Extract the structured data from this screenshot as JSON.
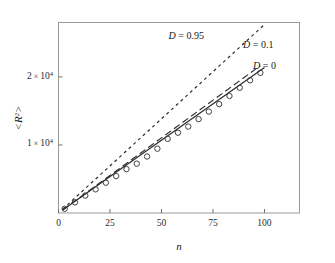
{
  "chart_data": {
    "type": "line",
    "title": "",
    "subtitle": "",
    "xlabel": "n",
    "ylabel": "<R^2>",
    "ylabel_display": "<R2>",
    "xlim": [
      0,
      117
    ],
    "ylim": [
      0,
      28000
    ],
    "grid": false,
    "legend_position": "inline-right",
    "frame": "box",
    "xticks": [
      0,
      25,
      50,
      75,
      100
    ],
    "xtick_labels": [
      "0",
      "25",
      "50",
      "75",
      "100"
    ],
    "yticks": [
      10000,
      20000
    ],
    "ytick_labels": [
      "1 × 10⁴",
      "2 × 10⁴"
    ],
    "ytick_mantissa": [
      "1",
      "2"
    ],
    "ytick_base": "10",
    "ytick_exponent": "4",
    "ytick_times": "×",
    "annotations": [
      {
        "text": "D = 0.95",
        "var": "D",
        "eq": "= 0.95",
        "x": 62,
        "y": 25600
      },
      {
        "text": "D = 0.1",
        "var": "D",
        "eq": "= 0.1",
        "x": 97,
        "y": 24300
      },
      {
        "text": "D = 0",
        "var": "D",
        "eq": "= 0",
        "x": 100,
        "y": 21100
      }
    ],
    "series": [
      {
        "name": "D = 0.95",
        "style": "dotted",
        "color": "#2b2b2b",
        "slope": 277.0,
        "x": [
          2,
          100
        ],
        "values": [
          554,
          27700
        ]
      },
      {
        "name": "D = 0.1",
        "style": "dashed",
        "color": "#2b2b2b",
        "slope": 221.0,
        "x": [
          2,
          98
        ],
        "values": [
          442,
          21658
        ]
      },
      {
        "name": "D = 0",
        "style": "solid",
        "color": "#2b2b2b",
        "slope": 214.0,
        "x": [
          2,
          100
        ],
        "values": [
          428,
          21400
        ]
      },
      {
        "name": "simulation data",
        "style": "open-circles",
        "color": "#3a3a3a",
        "marker": "o",
        "x": [
          3,
          8,
          13,
          18,
          23,
          28,
          33,
          38,
          43,
          48,
          53,
          58,
          63,
          68,
          73,
          78,
          83,
          88,
          93,
          98
        ],
        "values": [
          620,
          1560,
          2560,
          3480,
          4450,
          5420,
          6450,
          7250,
          8300,
          9450,
          10900,
          11800,
          12700,
          13800,
          14900,
          16000,
          17200,
          18400,
          19500,
          20600
        ]
      }
    ]
  }
}
